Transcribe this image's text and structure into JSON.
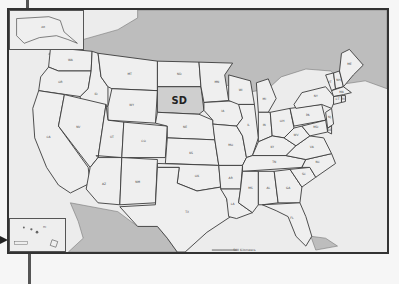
{
  "map": {
    "type": "United States state map",
    "highlighted_state": {
      "abbr": "SD",
      "name": "South Dakota",
      "fill": "#cfcfcf"
    },
    "colors": {
      "state_fill": "#efefef",
      "foreign_land": "#bdbdbd",
      "border": "#3a3a3a",
      "frame": "#333333"
    },
    "insets": [
      {
        "name": "alaska-inset",
        "label": "AK"
      },
      {
        "name": "hawaii-inset",
        "label": "HI"
      }
    ],
    "scale_bar": {
      "labels": [
        "500 Kilometers",
        "500 Miles"
      ]
    },
    "state_labels": [
      {
        "abbr": "WA"
      },
      {
        "abbr": "OR"
      },
      {
        "abbr": "CA"
      },
      {
        "abbr": "ID"
      },
      {
        "abbr": "NV"
      },
      {
        "abbr": "MT"
      },
      {
        "abbr": "WY"
      },
      {
        "abbr": "UT"
      },
      {
        "abbr": "AZ"
      },
      {
        "abbr": "CO"
      },
      {
        "abbr": "NM"
      },
      {
        "abbr": "ND"
      },
      {
        "abbr": "SD"
      },
      {
        "abbr": "NE"
      },
      {
        "abbr": "KS"
      },
      {
        "abbr": "OK"
      },
      {
        "abbr": "TX"
      },
      {
        "abbr": "MN"
      },
      {
        "abbr": "IA"
      },
      {
        "abbr": "MO"
      },
      {
        "abbr": "AR"
      },
      {
        "abbr": "LA"
      },
      {
        "abbr": "WI"
      },
      {
        "abbr": "IL"
      },
      {
        "abbr": "MI"
      },
      {
        "abbr": "IN"
      },
      {
        "abbr": "OH"
      },
      {
        "abbr": "KY"
      },
      {
        "abbr": "TN"
      },
      {
        "abbr": "MS"
      },
      {
        "abbr": "AL"
      },
      {
        "abbr": "GA"
      },
      {
        "abbr": "FL"
      },
      {
        "abbr": "SC"
      },
      {
        "abbr": "NC"
      },
      {
        "abbr": "VA"
      },
      {
        "abbr": "WV"
      },
      {
        "abbr": "PA"
      },
      {
        "abbr": "NY"
      },
      {
        "abbr": "ME"
      },
      {
        "abbr": "VT"
      },
      {
        "abbr": "NH"
      },
      {
        "abbr": "MA"
      },
      {
        "abbr": "CT"
      },
      {
        "abbr": "RI"
      },
      {
        "abbr": "NJ"
      },
      {
        "abbr": "DE"
      },
      {
        "abbr": "MD"
      }
    ]
  }
}
